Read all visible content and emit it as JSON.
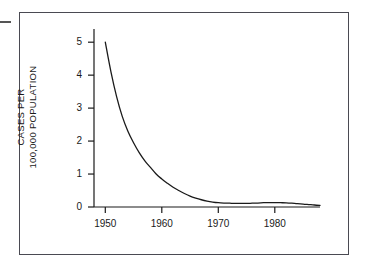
{
  "figure": {
    "background_color": "#ffffff",
    "frame_color": "#4a4a52",
    "line_color": "#1a1a1a",
    "edge_mark_label": "edge-mark"
  },
  "chart_data": {
    "type": "line",
    "title": "",
    "subtitle": "",
    "xlabel": "",
    "ylabel": "CASES PER 100,000 POPULATION",
    "ylabel_lines": [
      "CASES PER",
      "100,000 POPULATION"
    ],
    "xlim": [
      1948,
      1988
    ],
    "ylim": [
      0,
      5.4
    ],
    "xticks": [
      1950,
      1960,
      1970,
      1980
    ],
    "xtick_labels": [
      "1950",
      "1960",
      "1970",
      "1980"
    ],
    "yticks": [
      0,
      1,
      2,
      3,
      4,
      5
    ],
    "ytick_labels": [
      "0",
      "1",
      "2",
      "3",
      "4",
      "5"
    ],
    "grid": false,
    "legend": null,
    "legend_position": "none",
    "series": [
      {
        "name": "Cases per 100,000 population",
        "x": [
          1950,
          1951,
          1952,
          1953,
          1954,
          1955,
          1956,
          1957,
          1958,
          1959,
          1960,
          1961,
          1962,
          1963,
          1964,
          1965,
          1966,
          1967,
          1968,
          1969,
          1970,
          1971,
          1972,
          1973,
          1974,
          1975,
          1976,
          1977,
          1978,
          1979,
          1980,
          1981,
          1982,
          1983,
          1984,
          1985,
          1986,
          1987,
          1988
        ],
        "values": [
          5.0,
          4.1,
          3.35,
          2.75,
          2.3,
          1.95,
          1.65,
          1.4,
          1.2,
          1.0,
          0.85,
          0.72,
          0.6,
          0.5,
          0.41,
          0.33,
          0.27,
          0.22,
          0.18,
          0.15,
          0.13,
          0.12,
          0.115,
          0.11,
          0.11,
          0.11,
          0.115,
          0.12,
          0.13,
          0.135,
          0.135,
          0.13,
          0.125,
          0.115,
          0.1,
          0.09,
          0.075,
          0.06,
          0.05
        ]
      }
    ]
  }
}
